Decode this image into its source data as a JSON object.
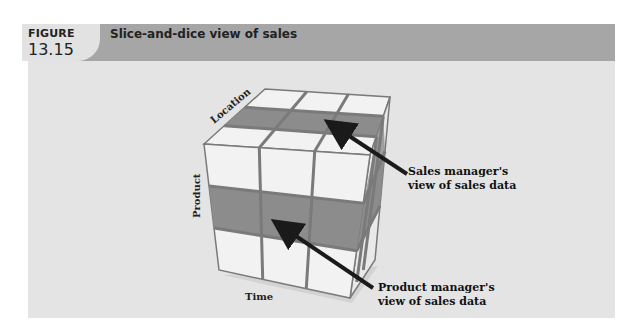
{
  "figure": {
    "label": "FIGURE",
    "number": "13.15",
    "title": "Slice-and-dice view of sales"
  },
  "cube": {
    "axes": {
      "location": "Location",
      "product": "Product",
      "time": "Time"
    },
    "grid": "3x3x3",
    "colors": {
      "cell": "#f2f2f2",
      "highlight": "#8c8c8c",
      "grid_line": "#7a7a7a",
      "panel_bg": "#e4e4e4",
      "header_bg": "#a6a6a6"
    }
  },
  "callouts": {
    "sales_manager": [
      "Sales manager's",
      "view of sales data"
    ],
    "product_manager": [
      "Product manager's",
      "view of sales data"
    ]
  }
}
